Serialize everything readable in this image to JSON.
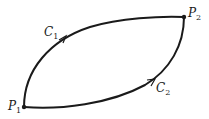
{
  "diagram": {
    "points": [
      {
        "id": "P1",
        "letter": "P",
        "subscript": "1",
        "x": 24,
        "y": 107
      },
      {
        "id": "P2",
        "letter": "P",
        "subscript": "2",
        "x": 184,
        "y": 17
      }
    ],
    "curves": [
      {
        "id": "C1",
        "letter": "C",
        "subscript": "1",
        "from": "P1",
        "to": "P2",
        "direction": "P1 to P2 (upper arc)"
      },
      {
        "id": "C2",
        "letter": "C",
        "subscript": "2",
        "from": "P1",
        "to": "P2",
        "direction": "P1 to P2 (lower arc)"
      }
    ],
    "colors": {
      "stroke": "#1a1a1a",
      "background": "#ffffff"
    }
  }
}
